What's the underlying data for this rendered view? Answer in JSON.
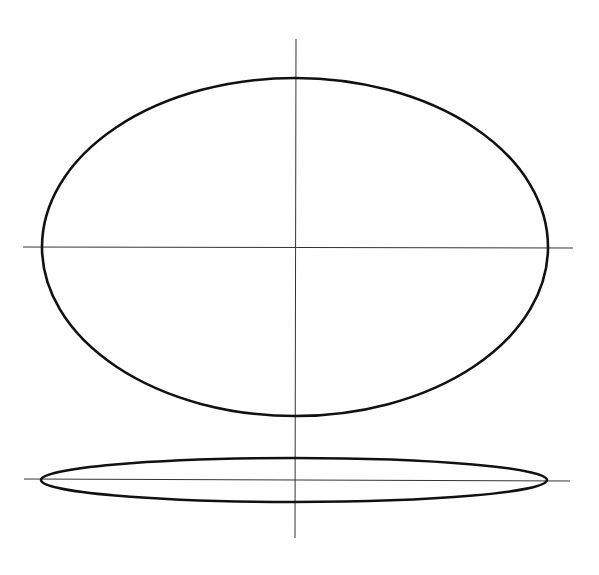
{
  "canvas": {
    "width": 599,
    "height": 575,
    "background": "#ffffff"
  },
  "colors": {
    "outline": "#111111",
    "axis": "#333333"
  },
  "figure": {
    "front_view": {
      "ellipse": {
        "cx": 295,
        "cy": 247,
        "rx": 253,
        "ry": 169
      },
      "horizontal_axis": {
        "x1": 23,
        "y1": 247,
        "x2": 573,
        "y2": 248
      },
      "stroke_width": 2.6
    },
    "edge_view": {
      "ellipse": {
        "cx": 294,
        "cy": 480,
        "rx": 253,
        "ry": 22
      },
      "horizontal_axis": {
        "x1": 24,
        "y1": 479,
        "x2": 570,
        "y2": 481
      },
      "stroke_width": 2.6
    },
    "vertical_axis": {
      "x1": 296,
      "y1": 39,
      "x2": 295,
      "y2": 538
    }
  }
}
